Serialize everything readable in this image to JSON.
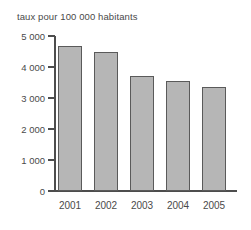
{
  "chart_data": {
    "type": "bar",
    "title": "taux pour 100 000 habitants",
    "xlabel": "",
    "ylabel": "",
    "categories": [
      "2001",
      "2002",
      "2003",
      "2004",
      "2005"
    ],
    "values": [
      4680,
      4480,
      3710,
      3550,
      3350
    ],
    "ylim": [
      0,
      5000
    ],
    "ytick_values": [
      0,
      1000,
      2000,
      3000,
      4000,
      5000
    ],
    "ytick_labels": [
      "0",
      "1 000",
      "2 000",
      "3 000",
      "4 000",
      "5 000"
    ],
    "grid": false,
    "legend": null,
    "bar_fill_color": "#b6b6b6",
    "bar_border_color": "#5a5a5a",
    "axis_color": "#4d4d4d",
    "background_color": "#ffffff"
  }
}
